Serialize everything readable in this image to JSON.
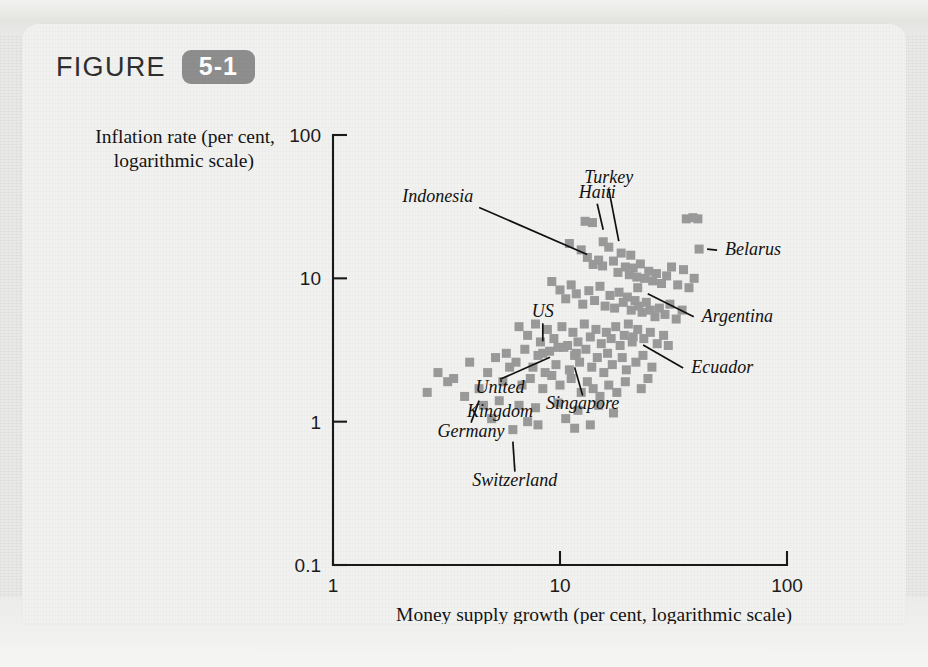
{
  "figure": {
    "label_word": "FIGURE",
    "number": "5-1"
  },
  "chart_data": {
    "type": "scatter",
    "title": "",
    "xlabel": "Money supply growth (per cent, logarithmic scale)",
    "ylabel": "Inflation rate (per cent, logarithmic scale)",
    "ylabel_line1": "Inflation rate (per cent,",
    "ylabel_line2": "logarithmic scale)",
    "xscale": "log",
    "yscale": "log",
    "xlim": [
      1,
      100
    ],
    "ylim": [
      0.1,
      100
    ],
    "xticks": [
      "1",
      "10",
      "100"
    ],
    "xtick_values": [
      1,
      10,
      100
    ],
    "yticks": [
      "100",
      "10",
      "1",
      "0.1"
    ],
    "ytick_values": [
      100,
      10,
      1,
      0.1
    ],
    "grid": false,
    "legend": "none",
    "marker": "square",
    "marker_color": "#9a9a9a",
    "annotations": [
      {
        "name": "Indonesia",
        "x": 14.0,
        "y": 12.5
      },
      {
        "name": "Haiti",
        "x": 15.5,
        "y": 18.0
      },
      {
        "name": "Turkey",
        "x": 20.5,
        "y": 14.5
      },
      {
        "name": "Belarus",
        "x": 41.0,
        "y": 16.0
      },
      {
        "name": "Argentina",
        "x": 22.0,
        "y": 8.6
      },
      {
        "name": "Ecuador",
        "x": 21.0,
        "y": 3.9
      },
      {
        "name": "US",
        "x": 8.4,
        "y": 3.0
      },
      {
        "name": "United Kingdom",
        "x": 9.8,
        "y": 3.3
      },
      {
        "name": "Singapore",
        "x": 11.6,
        "y": 2.9
      },
      {
        "name": "Germany",
        "x": 4.4,
        "y": 1.7
      },
      {
        "name": "Switzerland",
        "x": 6.2,
        "y": 0.88
      }
    ],
    "points": [
      [
        14.0,
        12.5
      ],
      [
        15.5,
        18.0
      ],
      [
        20.5,
        14.5
      ],
      [
        41.0,
        16.0
      ],
      [
        22.0,
        8.6
      ],
      [
        21.0,
        3.9
      ],
      [
        8.4,
        3.0
      ],
      [
        9.8,
        3.3
      ],
      [
        11.6,
        2.9
      ],
      [
        4.4,
        1.7
      ],
      [
        6.2,
        0.88
      ],
      [
        12.9,
        25.0
      ],
      [
        13.9,
        24.5
      ],
      [
        36.0,
        26.0
      ],
      [
        38.5,
        26.5
      ],
      [
        40.5,
        26.0
      ],
      [
        11.0,
        17.5
      ],
      [
        12.4,
        15.8
      ],
      [
        13.2,
        14.0
      ],
      [
        14.8,
        13.4
      ],
      [
        15.4,
        12.2
      ],
      [
        16.4,
        16.5
      ],
      [
        17.2,
        13.2
      ],
      [
        18.0,
        11.0
      ],
      [
        18.6,
        15.0
      ],
      [
        19.4,
        12.0
      ],
      [
        20.2,
        10.6
      ],
      [
        21.0,
        11.8
      ],
      [
        21.8,
        10.2
      ],
      [
        22.6,
        12.6
      ],
      [
        23.6,
        10.0
      ],
      [
        24.6,
        11.2
      ],
      [
        25.6,
        9.6
      ],
      [
        26.6,
        10.8
      ],
      [
        28.0,
        9.2
      ],
      [
        29.5,
        10.4
      ],
      [
        31.0,
        12.0
      ],
      [
        33.0,
        9.0
      ],
      [
        35.0,
        11.5
      ],
      [
        37.0,
        8.6
      ],
      [
        39.0,
        10.0
      ],
      [
        9.2,
        9.5
      ],
      [
        10.0,
        8.3
      ],
      [
        10.6,
        7.2
      ],
      [
        11.2,
        9.0
      ],
      [
        11.8,
        7.8
      ],
      [
        12.6,
        6.6
      ],
      [
        13.4,
        8.2
      ],
      [
        14.2,
        7.0
      ],
      [
        15.0,
        8.8
      ],
      [
        15.8,
        6.4
      ],
      [
        16.6,
        7.6
      ],
      [
        17.4,
        6.2
      ],
      [
        18.2,
        8.0
      ],
      [
        19.0,
        6.8
      ],
      [
        19.8,
        7.4
      ],
      [
        20.6,
        6.0
      ],
      [
        21.4,
        7.0
      ],
      [
        22.2,
        6.4
      ],
      [
        23.0,
        5.8
      ],
      [
        24.0,
        6.8
      ],
      [
        25.0,
        6.0
      ],
      [
        26.2,
        5.4
      ],
      [
        27.4,
        6.2
      ],
      [
        29.0,
        5.6
      ],
      [
        30.5,
        6.6
      ],
      [
        32.5,
        5.2
      ],
      [
        34.5,
        6.0
      ],
      [
        6.6,
        4.6
      ],
      [
        7.2,
        4.0
      ],
      [
        7.8,
        4.8
      ],
      [
        8.2,
        3.6
      ],
      [
        8.8,
        4.4
      ],
      [
        9.4,
        3.8
      ],
      [
        10.2,
        4.6
      ],
      [
        10.8,
        3.4
      ],
      [
        11.4,
        4.2
      ],
      [
        12.0,
        3.6
      ],
      [
        12.8,
        4.8
      ],
      [
        13.6,
        3.9
      ],
      [
        14.4,
        4.4
      ],
      [
        15.2,
        3.5
      ],
      [
        16.0,
        4.2
      ],
      [
        16.8,
        3.8
      ],
      [
        17.6,
        4.6
      ],
      [
        18.4,
        3.4
      ],
      [
        19.2,
        4.0
      ],
      [
        20.0,
        4.8
      ],
      [
        20.8,
        3.6
      ],
      [
        22.0,
        4.4
      ],
      [
        23.4,
        3.8
      ],
      [
        25.0,
        4.2
      ],
      [
        26.8,
        3.5
      ],
      [
        28.6,
        4.0
      ],
      [
        30.0,
        3.4
      ],
      [
        5.8,
        3.0
      ],
      [
        6.4,
        2.6
      ],
      [
        7.0,
        3.2
      ],
      [
        7.6,
        2.4
      ],
      [
        8.0,
        2.9
      ],
      [
        8.6,
        2.2
      ],
      [
        9.0,
        3.1
      ],
      [
        9.6,
        2.5
      ],
      [
        10.4,
        3.3
      ],
      [
        11.0,
        2.3
      ],
      [
        11.8,
        3.0
      ],
      [
        12.2,
        2.6
      ],
      [
        13.0,
        3.2
      ],
      [
        13.8,
        2.4
      ],
      [
        14.6,
        2.8
      ],
      [
        15.6,
        2.2
      ],
      [
        16.2,
        3.0
      ],
      [
        17.0,
        2.5
      ],
      [
        18.8,
        2.8
      ],
      [
        19.6,
        2.3
      ],
      [
        21.6,
        2.6
      ],
      [
        23.2,
        2.9
      ],
      [
        25.4,
        2.4
      ],
      [
        4.0,
        2.6
      ],
      [
        4.8,
        2.2
      ],
      [
        5.2,
        2.8
      ],
      [
        5.6,
        1.9
      ],
      [
        6.0,
        2.4
      ],
      [
        6.8,
        1.8
      ],
      [
        7.4,
        2.0
      ],
      [
        8.4,
        1.7
      ],
      [
        9.2,
        2.1
      ],
      [
        10.0,
        1.8
      ],
      [
        11.2,
        2.0
      ],
      [
        12.4,
        1.6
      ],
      [
        13.2,
        1.9
      ],
      [
        14.0,
        1.7
      ],
      [
        15.0,
        1.5
      ],
      [
        16.4,
        1.8
      ],
      [
        17.8,
        1.6
      ],
      [
        19.4,
        1.9
      ],
      [
        22.8,
        1.7
      ],
      [
        24.4,
        2.0
      ],
      [
        3.4,
        2.0
      ],
      [
        3.8,
        1.5
      ],
      [
        4.6,
        1.3
      ],
      [
        5.4,
        1.4
      ],
      [
        6.6,
        1.3
      ],
      [
        7.8,
        1.25
      ],
      [
        9.8,
        1.35
      ],
      [
        12.0,
        1.2
      ],
      [
        14.8,
        1.3
      ],
      [
        17.2,
        1.15
      ],
      [
        2.9,
        2.2
      ],
      [
        3.2,
        1.9
      ],
      [
        2.6,
        1.6
      ],
      [
        5.0,
        1.05
      ],
      [
        7.2,
        1.0
      ],
      [
        10.6,
        1.05
      ],
      [
        13.6,
        0.95
      ],
      [
        8.0,
        0.95
      ],
      [
        11.6,
        0.9
      ]
    ]
  }
}
